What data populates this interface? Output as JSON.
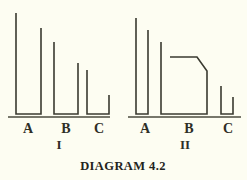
{
  "caption": "DIAGRAM 4.2",
  "background_color": "#fdfdf2",
  "stroke_color": "#3a3a30",
  "panels": [
    {
      "numeral": "I",
      "numeral_x": 59,
      "numeral_y": 149,
      "baseline": {
        "x1": 8,
        "x2": 110,
        "y": 117
      },
      "bars": [
        {
          "label": "A",
          "label_x": 28,
          "label_y": 133,
          "points": "16,13 16,114 41,114 41,28",
          "top_left_y": 13,
          "top_right_y": 28
        },
        {
          "label": "B",
          "label_x": 66,
          "label_y": 133,
          "points": "54,42 54,114 78,114 78,63",
          "top_left_y": 42,
          "top_right_y": 63
        },
        {
          "label": "C",
          "label_x": 99,
          "label_y": 133,
          "points": "87,70 87,114 109,114 109,95",
          "top_left_y": 70,
          "top_right_y": 95
        }
      ]
    },
    {
      "numeral": "II",
      "numeral_x": 185,
      "numeral_y": 149,
      "baseline": {
        "x1": 128,
        "x2": 241,
        "y": 117
      },
      "bars": [
        {
          "label": "A",
          "label_x": 145,
          "label_y": 133,
          "points": "136,18 136,114 148,114 148,30",
          "top_left_y": 18,
          "top_right_y": 30
        },
        {
          "label": "B",
          "label_x": 189,
          "label_y": 133,
          "points": "161,42 161,114 207,114 207,71 197,57 170,57",
          "top_left_y": 42,
          "plateau_y": 57,
          "top_right_y": 71
        },
        {
          "label": "C",
          "label_x": 228,
          "label_y": 133,
          "points": "221,86 221,114 233,114 233,97",
          "top_left_y": 86,
          "top_right_y": 97
        }
      ]
    }
  ],
  "caption_position": {
    "x": 123,
    "y": 170
  }
}
